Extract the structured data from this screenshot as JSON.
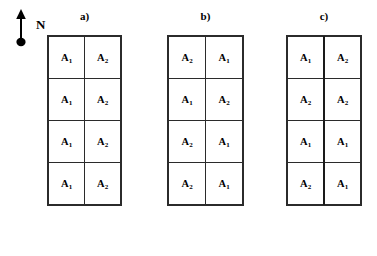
{
  "figure": {
    "compass": {
      "icon": "north-arrow-icon",
      "label": "N"
    },
    "panels": [
      {
        "id": "a",
        "label": "a)",
        "thick_center_divider": false,
        "rows": [
          [
            "A",
            "A"
          ],
          [
            "A",
            "A"
          ],
          [
            "A",
            "A"
          ],
          [
            "A",
            "A"
          ]
        ],
        "cells": [
          [
            {
              "base": "A",
              "sub": "1"
            },
            {
              "base": "A",
              "sub": "2"
            }
          ],
          [
            {
              "base": "A",
              "sub": "1"
            },
            {
              "base": "A",
              "sub": "2"
            }
          ],
          [
            {
              "base": "A",
              "sub": "1"
            },
            {
              "base": "A",
              "sub": "2"
            }
          ],
          [
            {
              "base": "A",
              "sub": "1"
            },
            {
              "base": "A",
              "sub": "2"
            }
          ]
        ]
      },
      {
        "id": "b",
        "label": "b)",
        "thick_center_divider": false,
        "cells": [
          [
            {
              "base": "A",
              "sub": "2"
            },
            {
              "base": "A",
              "sub": "1"
            }
          ],
          [
            {
              "base": "A",
              "sub": "1"
            },
            {
              "base": "A",
              "sub": "2"
            }
          ],
          [
            {
              "base": "A",
              "sub": "2"
            },
            {
              "base": "A",
              "sub": "1"
            }
          ],
          [
            {
              "base": "A",
              "sub": "2"
            },
            {
              "base": "A",
              "sub": "1"
            }
          ]
        ]
      },
      {
        "id": "c",
        "label": "c)",
        "thick_center_divider": true,
        "cells": [
          [
            {
              "base": "A",
              "sub": "1"
            },
            {
              "base": "A",
              "sub": "2"
            }
          ],
          [
            {
              "base": "A",
              "sub": "2"
            },
            {
              "base": "A",
              "sub": "2"
            }
          ],
          [
            {
              "base": "A",
              "sub": "1"
            },
            {
              "base": "A",
              "sub": "1"
            }
          ],
          [
            {
              "base": "A",
              "sub": "2"
            },
            {
              "base": "A",
              "sub": "1"
            }
          ]
        ]
      }
    ],
    "colors": {
      "background": "#ffffff",
      "ink": "#000000",
      "grid_line": "#2b2b2b",
      "thick_line": "#1a1a1a"
    }
  }
}
